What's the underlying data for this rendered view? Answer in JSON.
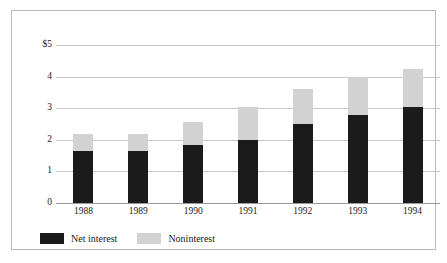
{
  "chart_data": {
    "type": "bar",
    "subtype": "stacked-vertical",
    "title": "",
    "xlabel": "",
    "ylabel": "",
    "categories": [
      "1988",
      "1989",
      "1990",
      "1991",
      "1992",
      "1993",
      "1994"
    ],
    "series": [
      {
        "name": "Net interest",
        "color": "#1b1b1b",
        "values": [
          1.65,
          1.65,
          1.85,
          2.0,
          2.5,
          2.8,
          3.05
        ]
      },
      {
        "name": "Noninterest",
        "color": "#d2d2d2",
        "values": [
          0.55,
          0.55,
          0.7,
          1.05,
          1.1,
          1.2,
          1.2
        ]
      }
    ],
    "totals": [
      2.2,
      2.2,
      2.55,
      3.05,
      3.6,
      4.0,
      4.25
    ],
    "ylim": [
      0,
      5
    ],
    "ytick_values": [
      0,
      1,
      2,
      3,
      4,
      5
    ],
    "ytick_labels": [
      "0",
      "1",
      "2",
      "3",
      "4",
      "$5"
    ],
    "grid": true,
    "legend_position": "bottom-left",
    "currency_symbol": "$"
  },
  "legend": {
    "items": [
      {
        "label": "Net interest",
        "swatch": "black-swatch"
      },
      {
        "label": "Noninterest",
        "swatch": "gray-swatch"
      }
    ]
  }
}
